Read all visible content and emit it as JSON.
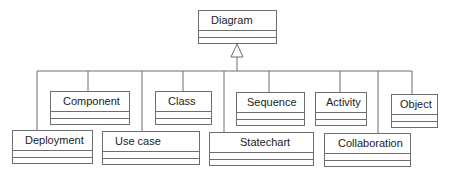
{
  "diagram": {
    "type": "uml-class-generalization",
    "root": {
      "name": "Diagram"
    },
    "subclasses_top_row": [
      {
        "name": "Component"
      },
      {
        "name": "Class"
      },
      {
        "name": "Sequence"
      },
      {
        "name": "Activity"
      },
      {
        "name": "Object"
      }
    ],
    "subclasses_bottom_row": [
      {
        "name": "Deployment"
      },
      {
        "name": "Use case"
      },
      {
        "name": "Statechart"
      },
      {
        "name": "Collaboration"
      }
    ],
    "relationship": "generalization",
    "line_color": "#6e6e6e"
  }
}
